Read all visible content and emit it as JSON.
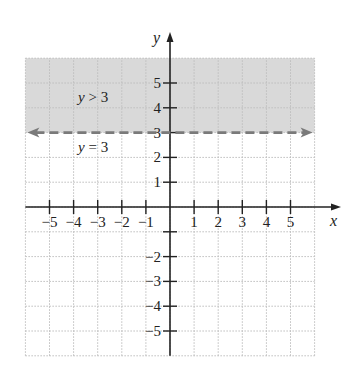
{
  "chart_data": {
    "type": "inequality-graph",
    "title": "",
    "xlabel": "x",
    "ylabel": "y",
    "xlim": [
      -6,
      6
    ],
    "ylim": [
      -6,
      6
    ],
    "grid": true,
    "x_ticks": [
      -5,
      -4,
      -3,
      -2,
      -1,
      1,
      2,
      3,
      4,
      5
    ],
    "y_ticks": [
      -5,
      -4,
      -3,
      -2,
      1,
      2,
      3,
      4,
      5
    ],
    "x_tick_labels": [
      "−5",
      "−4",
      "−3",
      "−2",
      "−1",
      "1",
      "2",
      "3",
      "4",
      "5"
    ],
    "y_tick_labels": [
      "−5",
      "−4",
      "−3",
      "−2",
      "1",
      "2",
      "3",
      "4",
      "5"
    ],
    "boundary_line": {
      "equation": "y = 3",
      "y": 3,
      "style": "dashed",
      "arrows": "both"
    },
    "shaded_region": {
      "inequality": "y > 3",
      "from_y": 3,
      "to_y": 6
    },
    "annotations": [
      {
        "text": "y > 3",
        "x": -3.5,
        "y": 4.4
      },
      {
        "text": "y = 3",
        "x": -3.5,
        "y": 2.3
      }
    ]
  },
  "colors": {
    "shade": "#d9d9d9",
    "grid": "#bdbdbd",
    "axis": "#222222",
    "boundary": "#7a7a7a"
  },
  "labels": {
    "x_axis": "x",
    "y_axis": "y",
    "region_label_var": "y",
    "region_label_rest": " > 3",
    "line_label_var": "y",
    "line_label_rest": " = 3"
  }
}
